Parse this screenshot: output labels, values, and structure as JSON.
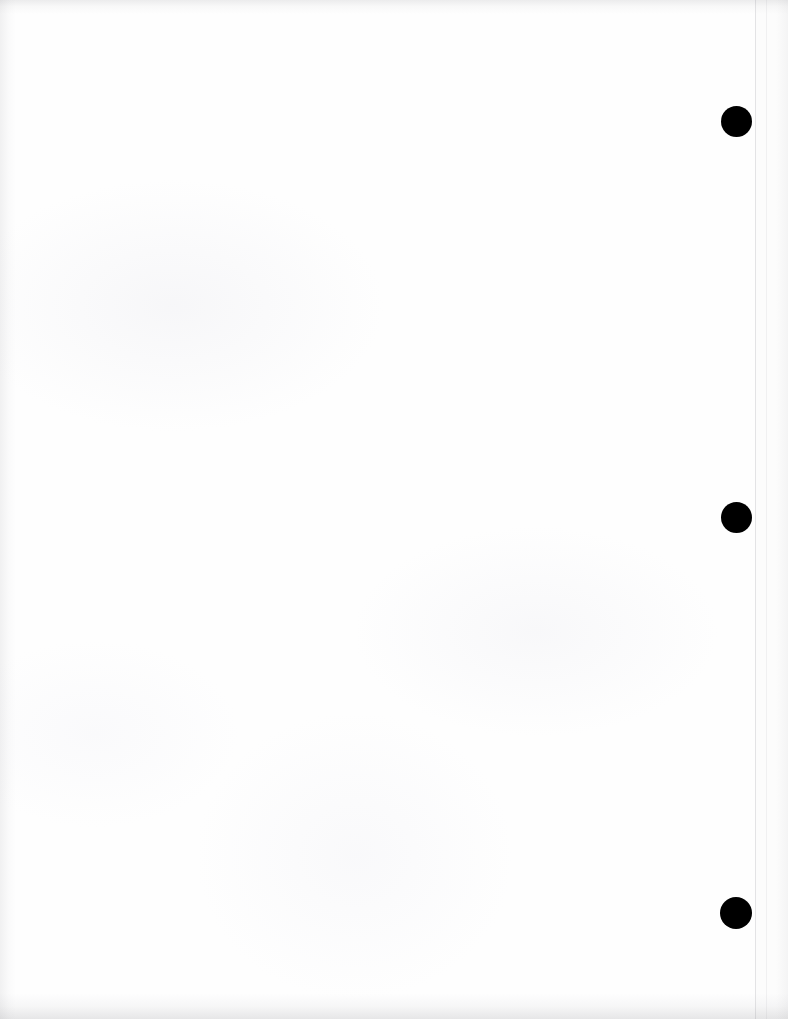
{
  "document": {
    "type": "scanned-page",
    "title": "Scanned Blank Page",
    "page_width_px": 788,
    "page_height_px": 1019,
    "background_color": "#ffffff",
    "paper_color": "#fefefe",
    "content_text": "",
    "content_note": "",
    "orientation": "portrait"
  },
  "page_edge": {
    "name": "sheet-right-edge",
    "x_px": 755,
    "color": "#aaaaaf",
    "visible": true
  },
  "punch_marks": {
    "name": "binder-hole-punch-marks",
    "count": 3,
    "color": "#000000",
    "diameter_px": 31,
    "center_x_px": 736,
    "items": [
      {
        "label": "top-punch-mark",
        "center_x": 736,
        "center_y": 121,
        "diameter": 31
      },
      {
        "label": "middle-punch-mark",
        "center_x": 736,
        "center_y": 517,
        "diameter": 31
      },
      {
        "label": "bottom-punch-mark",
        "center_x": 736,
        "center_y": 913,
        "diameter": 32
      }
    ]
  },
  "scan_artifacts": {
    "top_shadow": true,
    "bottom_shadow": true,
    "left_shadow": true,
    "right_shadow": true,
    "shadow_color": "#8c8c90"
  }
}
